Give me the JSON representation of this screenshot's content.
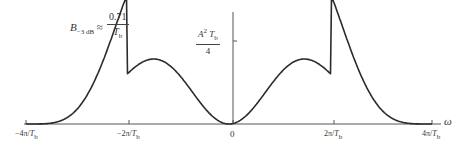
{
  "chart_data": {
    "type": "line",
    "title": "",
    "function": "S(w) = (A^2 Tb/4) * sinc^2(w Tb/4) * sin^2(w Tb/4)",
    "xlabel": "ω",
    "ylabel": "",
    "x_ticks": [
      "-4π/Tb",
      "-2π/Tb",
      "0",
      "2π/Tb",
      "4π/Tb"
    ],
    "x_tick_values": [
      -4,
      -2,
      0,
      2,
      4
    ],
    "x_unit": "π/Tb",
    "y_tick_label": "A²Tb/4",
    "y_tick_value": 1.0,
    "xlim": [
      -4,
      4
    ],
    "ylim": [
      0,
      1.0
    ],
    "grid": false,
    "legend": null,
    "series": [
      {
        "name": "S(ω)",
        "x": [
          -4,
          -3.5,
          -3,
          -2.5,
          -2,
          -1.5,
          -1,
          -0.5,
          0,
          0.5,
          1,
          1.5,
          2,
          2.5,
          3,
          3.5,
          4
        ],
        "values": [
          0.0,
          0.03,
          0.05,
          0.03,
          0.0,
          0.24,
          0.81,
          0.44,
          0.0,
          0.44,
          0.81,
          0.24,
          0.0,
          0.03,
          0.05,
          0.03,
          0.0
        ]
      }
    ],
    "annotations": [
      {
        "text": "B−3 dB ≈ 0.71 / Tb"
      },
      {
        "text": "A²Tb/4",
        "position": "y-axis tick"
      }
    ],
    "peaks": {
      "x": [
        -1.16,
        1.16
      ],
      "relative_height": 0.72
    }
  },
  "annotation": {
    "bandwidth_symbol": "B",
    "bandwidth_sub": "−3 dB",
    "approx": "≈",
    "numerator": "0.71",
    "denominator_base": "T",
    "denominator_sub": "b"
  },
  "y_tick": {
    "num_A": "A",
    "num_sup": "2",
    "num_T": "T",
    "num_sub": "b",
    "den": "4"
  },
  "x_tick_labels": [
    {
      "pre": "−4π/",
      "T": "T",
      "sub": "b"
    },
    {
      "pre": "−2π/",
      "T": "T",
      "sub": "b"
    },
    {
      "pre": "0",
      "T": "",
      "sub": ""
    },
    {
      "pre": "2π/",
      "T": "T",
      "sub": "b"
    },
    {
      "pre": "4π/",
      "T": "T",
      "sub": "b"
    }
  ],
  "axis_label": "ω",
  "colors": {
    "curve": "#2b2b2b",
    "axis": "#555555",
    "background": "#ffffff"
  }
}
